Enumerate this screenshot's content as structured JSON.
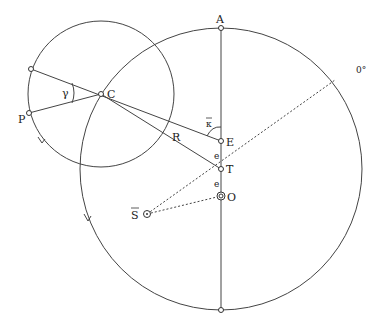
{
  "diagram": {
    "labels": {
      "A": "A",
      "C": "C",
      "P": "P",
      "R": "R",
      "E": "E",
      "T": "T",
      "O": "O",
      "S": "S",
      "gamma": "γ",
      "kappa": "κ",
      "e1": "e",
      "e2": "e",
      "zero_deg": "0°"
    },
    "colors": {
      "stroke": "#333333",
      "background": "#ffffff"
    }
  }
}
